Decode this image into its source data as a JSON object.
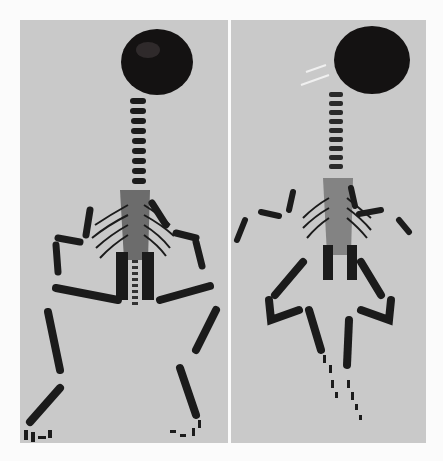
{
  "figure": {
    "background": "#fbfbfb",
    "panel_color": "#c9c9c9",
    "bone_color": "#1a1a1a",
    "skull_color": "#141212",
    "panels": [
      {
        "id": "left",
        "subject": "stained-skeleton-specimen",
        "pose": "dorsal view, limbs spread"
      },
      {
        "id": "right",
        "subject": "stained-skeleton-specimen",
        "pose": "dorsal view, hind limbs crossed"
      }
    ]
  }
}
